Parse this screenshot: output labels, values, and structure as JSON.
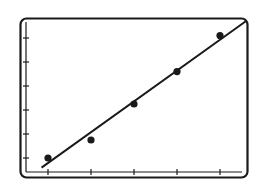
{
  "chart_data": {
    "type": "scatter",
    "title": "",
    "xlabel": "",
    "ylabel": "",
    "x_ticks": [
      1,
      2,
      3,
      4,
      5
    ],
    "y_ticks": [
      1,
      2,
      3,
      4,
      5,
      6
    ],
    "xlim": [
      0.5,
      5.5
    ],
    "ylim": [
      0.5,
      6.6
    ],
    "grid": false,
    "legend": null,
    "series": [
      {
        "name": "data points",
        "x": [
          1,
          2,
          3,
          4,
          5
        ],
        "y": [
          1.0,
          1.75,
          3.25,
          4.6,
          6.1
        ]
      }
    ],
    "fit_line": {
      "name": "linear fit",
      "x": [
        0.85,
        5.6
      ],
      "y": [
        0.6,
        6.7
      ]
    }
  },
  "colors": {
    "ink": "#1a1a1a",
    "background": "#ffffff"
  }
}
